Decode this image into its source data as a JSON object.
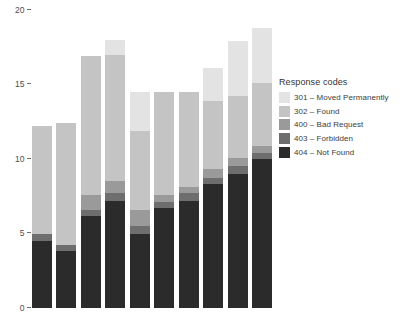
{
  "chart_data": {
    "type": "bar",
    "subtype": "stacked-bar",
    "title": "",
    "xlabel": "",
    "ylabel": "",
    "ylim": [
      0,
      20
    ],
    "y_ticks": [
      0,
      5,
      10,
      15,
      20
    ],
    "y_tick_labels": [
      "0",
      "5",
      "10",
      "15",
      "20"
    ],
    "x_tick_labels": [
      "",
      "",
      "",
      "",
      "",
      "",
      "",
      "",
      "",
      ""
    ],
    "grid": false,
    "legend_position": "right",
    "bar_count": 10,
    "categories": [
      "1",
      "2",
      "3",
      "4",
      "5",
      "6",
      "7",
      "8",
      "9",
      "10"
    ],
    "series": [
      {
        "name": "404 – Not Found",
        "code": "404",
        "color": "#2b2b2b",
        "values": [
          4.5,
          3.8,
          6.2,
          7.2,
          5.0,
          6.7,
          7.2,
          8.3,
          9.0,
          10.0
        ]
      },
      {
        "name": "403 – Forbidden",
        "code": "403",
        "color": "#6e6e6e",
        "values": [
          0.5,
          0.4,
          0.4,
          0.5,
          0.5,
          0.4,
          0.5,
          0.4,
          0.5,
          0.4
        ]
      },
      {
        "name": "400 – Bad Request",
        "code": "400",
        "color": "#9a9a9a",
        "values": [
          0.0,
          0.0,
          1.0,
          0.8,
          1.1,
          0.5,
          0.4,
          0.6,
          0.6,
          0.5
        ]
      },
      {
        "name": "302 – Found",
        "code": "302",
        "color": "#c4c4c4",
        "values": [
          7.2,
          8.2,
          9.3,
          8.5,
          5.3,
          6.9,
          6.4,
          4.6,
          4.1,
          4.2
        ]
      },
      {
        "name": "301 – Moved Permanently",
        "code": "301",
        "color": "#e3e3e3",
        "values": [
          0.0,
          0.0,
          0.0,
          1.0,
          2.6,
          0.0,
          0.0,
          2.2,
          3.7,
          3.7
        ]
      }
    ],
    "totals": [
      12.2,
      12.4,
      16.9,
      18.0,
      14.5,
      14.5,
      14.5,
      16.1,
      17.3,
      18.8
    ]
  },
  "legend": {
    "title": "Response codes",
    "items": [
      {
        "label": "301 – Moved Permanently",
        "color": "#e3e3e3"
      },
      {
        "label": "302 – Found",
        "color": "#c4c4c4"
      },
      {
        "label": "400 – Bad Request",
        "color": "#9a9a9a"
      },
      {
        "label": "403 – Forbidden",
        "color": "#6e6e6e"
      },
      {
        "label": "404 – Not Found",
        "color": "#2b2b2b"
      }
    ]
  },
  "axis": {
    "tick_color": "#6e6e6e",
    "label_color": "#4d4d4d"
  }
}
